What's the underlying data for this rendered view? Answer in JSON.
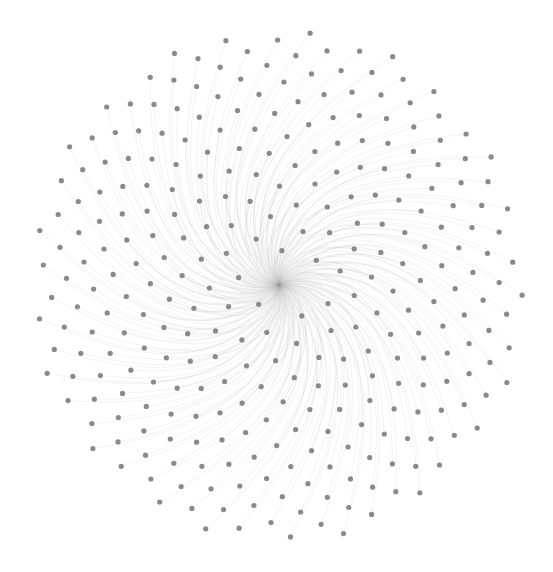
{
  "graph": {
    "type": "network",
    "layout": "radial-spiral",
    "width": 553,
    "height": 572,
    "background": "#ffffff",
    "hub": {
      "x": 279,
      "y": 285,
      "color": "#9a9a9a",
      "radius": 2
    },
    "nodes": {
      "count": 300,
      "color": "#8a8a8a",
      "radius": 2.6,
      "outer_radius": 248,
      "inner_radius": 14,
      "golden_angle_deg": 137.508,
      "y_scale": 1.04
    },
    "edges": {
      "color": "#b0b0b0",
      "opacity": 0.22,
      "width": 0.7,
      "curl_deg": 55
    }
  }
}
